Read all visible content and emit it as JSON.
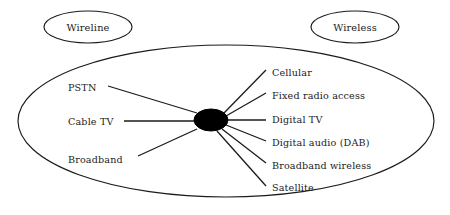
{
  "diagram": {
    "background_color": "#ffffff",
    "line_color": "#1b1b1b",
    "hub_color": "#000000",
    "groups": [
      {
        "id": "wireline",
        "label": "Wireline",
        "cx": 88,
        "cy": 27,
        "rx": 44,
        "ry": 16
      },
      {
        "id": "wireless",
        "label": "Wireless",
        "cx": 355,
        "cy": 27,
        "rx": 44,
        "ry": 16
      }
    ],
    "boundary": {
      "cx": 226,
      "cy": 121,
      "rx": 208,
      "ry": 76
    },
    "hub": {
      "cx": 211,
      "cy": 120,
      "rx": 17,
      "ry": 11
    },
    "wireline_nodes": [
      {
        "label": "PSTN",
        "text_x": 68,
        "text_y": 91,
        "line_x1": 108,
        "line_y1": 86,
        "line_x2": 197,
        "line_y2": 113
      },
      {
        "label": "Cable TV",
        "text_x": 68,
        "text_y": 125,
        "line_x1": 124,
        "line_y1": 121,
        "line_x2": 194,
        "line_y2": 121
      },
      {
        "label": "Broadband",
        "text_x": 68,
        "text_y": 163,
        "line_x1": 138,
        "line_y1": 156,
        "line_x2": 197,
        "line_y2": 129
      }
    ],
    "wireless_nodes": [
      {
        "label": "Cellular",
        "text_x": 272,
        "text_y": 76,
        "line_x1": 224,
        "line_y1": 113,
        "line_x2": 266,
        "line_y2": 70
      },
      {
        "label": "Fixed radio access",
        "text_x": 272,
        "text_y": 99,
        "line_x1": 226,
        "line_y1": 116,
        "line_x2": 266,
        "line_y2": 93
      },
      {
        "label": "Digital TV",
        "text_x": 272,
        "text_y": 123,
        "line_x1": 228,
        "line_y1": 120,
        "line_x2": 266,
        "line_y2": 120
      },
      {
        "label": "Digital audio (DAB)",
        "text_x": 272,
        "text_y": 146,
        "line_x1": 226,
        "line_y1": 125,
        "line_x2": 266,
        "line_y2": 141
      },
      {
        "label": "Broadband wireless",
        "text_x": 272,
        "text_y": 169,
        "line_x1": 222,
        "line_y1": 129,
        "line_x2": 266,
        "line_y2": 163
      },
      {
        "label": "Satellite",
        "text_x": 272,
        "text_y": 191,
        "line_x1": 217,
        "line_y1": 131,
        "line_x2": 266,
        "line_y2": 186
      }
    ]
  }
}
